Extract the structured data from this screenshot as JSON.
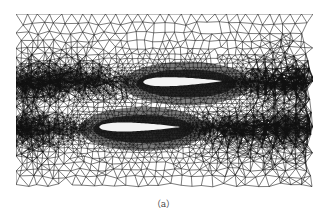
{
  "figure": {
    "caption": "（a）",
    "colors": {
      "background": "#ffffff",
      "mesh_line": "#111111",
      "airfoil_fill": "#f4f4f4"
    },
    "mesh_region": {
      "x": 16,
      "y": 14,
      "width": 297,
      "height": 177
    },
    "airfoils": [
      {
        "name": "upper-airfoil",
        "leading_edge": [
          143,
          82
        ],
        "trailing_edge": [
          222,
          81
        ],
        "max_thickness": 9
      },
      {
        "name": "lower-airfoil",
        "leading_edge": [
          99,
          127
        ],
        "trailing_edge": [
          180,
          127
        ],
        "max_thickness": 9
      }
    ]
  }
}
